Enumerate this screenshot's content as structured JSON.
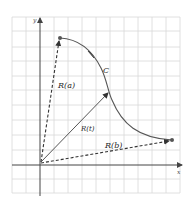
{
  "figure": {
    "type": "vector-valued function diagram",
    "axes": {
      "x_label": "x",
      "y_label": "y"
    },
    "curve": {
      "label": "C"
    },
    "vectors": [
      {
        "label": "R(a)",
        "style": "dashed"
      },
      {
        "label": "R(t)",
        "style": "solid"
      },
      {
        "label": "R(b)",
        "style": "dashed"
      }
    ],
    "colors": {
      "grid": "#d8d8d8",
      "axis": "#444444",
      "curve": "#555555",
      "vector": "#333333",
      "background": "#ffffff"
    }
  }
}
